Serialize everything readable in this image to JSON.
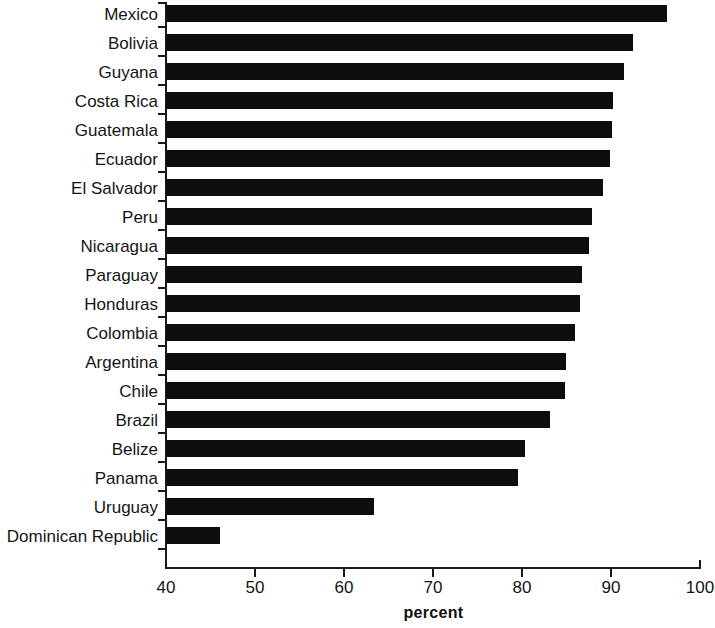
{
  "chart_data": {
    "type": "bar",
    "orientation": "horizontal",
    "title": "",
    "subtitle": "",
    "xlabel": "percent",
    "ylabel": "",
    "xlim": [
      40,
      100
    ],
    "xticks": [
      40,
      50,
      60,
      70,
      80,
      90,
      100
    ],
    "xtick_labels": [
      "40",
      "50",
      "60",
      "70",
      "80",
      "90",
      "100"
    ],
    "grid": false,
    "legend": null,
    "bar_color": "#0d0d0d",
    "axis_color": "#1a1a1a",
    "categories": [
      "Mexico",
      "Bolivia",
      "Guyana",
      "Costa Rica",
      "Guatemala",
      "Ecuador",
      "El Salvador",
      "Peru",
      "Nicaragua",
      "Paraguay",
      "Honduras",
      "Colombia",
      "Argentina",
      "Chile",
      "Brazil",
      "Belize",
      "Panama",
      "Uruguay",
      "Dominican Republic"
    ],
    "values": [
      96.3,
      92.5,
      91.5,
      90.2,
      90.1,
      89.9,
      89.1,
      87.9,
      87.5,
      86.7,
      86.5,
      85.9,
      84.9,
      84.8,
      83.1,
      80.3,
      79.6,
      63.4,
      46.1
    ]
  }
}
